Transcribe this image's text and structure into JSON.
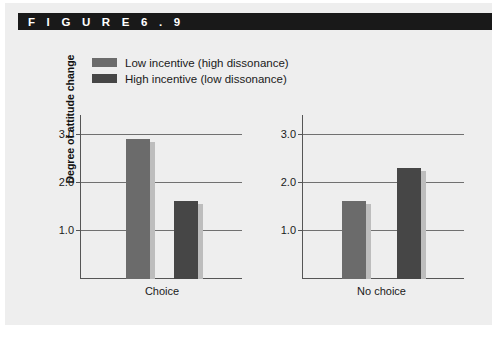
{
  "figure": {
    "header_label": "F I G U R E   6 . 9",
    "panel_bg": "#eeeeee",
    "header_bg": "#191919"
  },
  "legend": {
    "items": [
      {
        "label": "Low incentive (high dissonance)",
        "color": "#6b6b6b"
      },
      {
        "label": "High incentive (low dissonance)",
        "color": "#464646"
      }
    ]
  },
  "chart_data": {
    "type": "bar",
    "title": "",
    "xlabel": "",
    "ylabel": "Degree of attitude change",
    "ylim": [
      0,
      3.4
    ],
    "yticks": [
      1.0,
      2.0,
      3.0
    ],
    "ytick_labels": [
      "1.0",
      "2.0",
      "3.0"
    ],
    "grid": true,
    "legend_position": "top-center",
    "categories": [
      "Choice",
      "No choice"
    ],
    "series": [
      {
        "name": "Low incentive (high dissonance)",
        "color": "#6b6b6b",
        "values": [
          2.93,
          1.63
        ]
      },
      {
        "name": "High incentive (low dissonance)",
        "color": "#464646",
        "values": [
          1.63,
          2.32
        ]
      }
    ],
    "panels": [
      {
        "name": "Choice",
        "xlabel": "Choice",
        "bars": [
          {
            "series": "Low incentive (high dissonance)",
            "value": 2.93,
            "color": "#6b6b6b"
          },
          {
            "series": "High incentive (low dissonance)",
            "value": 1.63,
            "color": "#464646"
          }
        ]
      },
      {
        "name": "No choice",
        "xlabel": "No choice",
        "bars": [
          {
            "series": "Low incentive (high dissonance)",
            "value": 1.63,
            "color": "#6b6b6b"
          },
          {
            "series": "High incentive (low dissonance)",
            "value": 2.32,
            "color": "#464646"
          }
        ]
      }
    ]
  }
}
